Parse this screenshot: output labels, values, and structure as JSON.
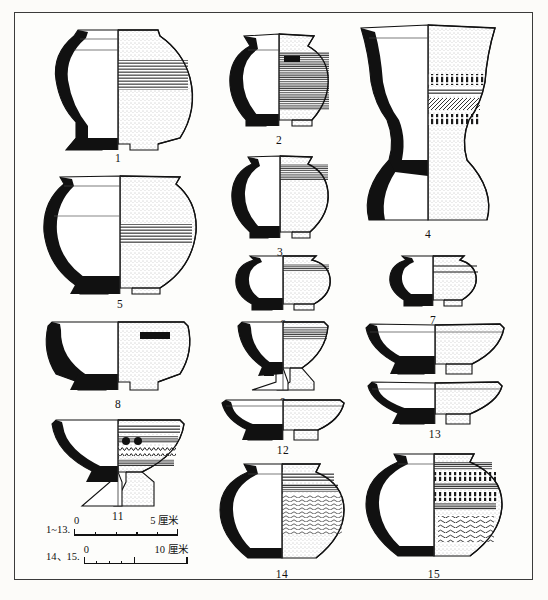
{
  "figure": {
    "type": "archaeological-pottery-plate",
    "border_color": "#3b3b3b",
    "ink_color": "#111111",
    "background_color": "#fdfdfb"
  },
  "scales": [
    {
      "label": "1~13.",
      "zero": "0",
      "max": "5 厘米",
      "ticks": 5,
      "unit": "厘米",
      "applies_to": "vessels 1-13"
    },
    {
      "label": "14、15.",
      "zero": "0",
      "max": "10 厘米",
      "ticks": 5,
      "unit": "厘米",
      "applies_to": "vessels 14-15"
    }
  ],
  "vessels": [
    {
      "num": "1",
      "form": "carinated-jar-ring-foot",
      "decor": "horizontal-banding"
    },
    {
      "num": "2",
      "form": "globular-jar-ring-foot",
      "decor": "dense-horizontal-striation"
    },
    {
      "num": "3",
      "form": "globular-bowl-ring-foot",
      "decor": "shoulder-band"
    },
    {
      "num": "4",
      "form": "tall-pedestal-goblet",
      "decor": "comb-impressed-bands"
    },
    {
      "num": "5",
      "form": "carinated-jar-ring-foot",
      "decor": "horizontal-banding"
    },
    {
      "num": "6",
      "form": "squat-bowl-ring-foot",
      "decor": "shoulder-band"
    },
    {
      "num": "7",
      "form": "squat-bowl-ring-foot",
      "decor": "double-groove"
    },
    {
      "num": "8",
      "form": "deep-bowl-ring-foot",
      "decor": "plain-with-mark"
    },
    {
      "num": "9",
      "form": "bowl-pedestal-foot",
      "decor": "rim-bands"
    },
    {
      "num": "10",
      "form": "shallow-bowl-ring-foot",
      "decor": "plain"
    },
    {
      "num": "11",
      "form": "pedestal-bowl",
      "decor": "zigzag-bands-and-knobs"
    },
    {
      "num": "12",
      "form": "shallow-bowl-ring-foot",
      "decor": "plain"
    },
    {
      "num": "13",
      "form": "shallow-bowl-ring-foot",
      "decor": "plain"
    },
    {
      "num": "14",
      "form": "globular-jar",
      "decor": "wavy-cord-impressed"
    },
    {
      "num": "15",
      "form": "globular-jar",
      "decor": "comb-bands-and-wave-motif"
    }
  ]
}
